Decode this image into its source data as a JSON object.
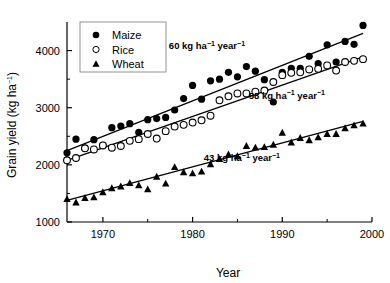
{
  "chart_data": {
    "type": "scatter",
    "title": "",
    "xlabel": "Year",
    "ylabel": "Grain yield (kg ha⁻¹)",
    "xlim": [
      1966,
      2000
    ],
    "ylim": [
      1000,
      4500
    ],
    "xticks": [
      1970,
      1980,
      1990,
      2000
    ],
    "xtick_labels": [
      "1970",
      "1980",
      "1990",
      "2000"
    ],
    "xminor": [
      1975,
      1985,
      1995
    ],
    "yticks": [
      1000,
      2000,
      3000,
      4000
    ],
    "ytick_labels": [
      "1000",
      "2000",
      "3000",
      "4000"
    ],
    "yminor": [
      1500,
      2500,
      3500
    ],
    "grid": false,
    "legend_position": "top-left",
    "series": [
      {
        "name": "Maize",
        "marker": "filled-circle",
        "color": "#000000",
        "x": [
          1966,
          1967,
          1968,
          1969,
          1970,
          1971,
          1972,
          1973,
          1974,
          1975,
          1976,
          1977,
          1978,
          1979,
          1980,
          1981,
          1982,
          1983,
          1984,
          1985,
          1986,
          1987,
          1988,
          1989,
          1990,
          1991,
          1992,
          1993,
          1994,
          1995,
          1996,
          1997,
          1998,
          1999
        ],
        "y": [
          2210,
          2450,
          2290,
          2440,
          2340,
          2650,
          2680,
          2720,
          2570,
          2790,
          2810,
          2830,
          2960,
          3160,
          3390,
          3150,
          3470,
          3500,
          3620,
          3540,
          3720,
          3640,
          3490,
          3100,
          3620,
          3690,
          3690,
          3900,
          3770,
          4100,
          3800,
          4160,
          4110,
          4440
        ],
        "fit_label": "60 kg ha⁻¹ year⁻¹",
        "fit_slope": 60,
        "fit_intercept_year": 1966,
        "fit_y_start": 2250,
        "fit_y_end": 4300
      },
      {
        "name": "Rice",
        "marker": "open-circle",
        "color": "#000000",
        "x": [
          1966,
          1967,
          1968,
          1969,
          1970,
          1971,
          1972,
          1973,
          1974,
          1975,
          1976,
          1977,
          1978,
          1979,
          1980,
          1981,
          1982,
          1983,
          1984,
          1985,
          1986,
          1987,
          1988,
          1989,
          1990,
          1991,
          1992,
          1993,
          1994,
          1995,
          1996,
          1997,
          1998,
          1999
        ],
        "y": [
          2080,
          2120,
          2290,
          2270,
          2340,
          2300,
          2330,
          2420,
          2450,
          2540,
          2460,
          2590,
          2670,
          2700,
          2740,
          2780,
          2860,
          3130,
          3200,
          3250,
          3250,
          3280,
          3300,
          3450,
          3570,
          3610,
          3620,
          3670,
          3680,
          3740,
          3650,
          3800,
          3820,
          3850
        ],
        "fit_label": "58 kg ha⁻¹ year⁻¹",
        "fit_slope": 58,
        "fit_intercept_year": 1966,
        "fit_y_start": 2080,
        "fit_y_end": 3890
      },
      {
        "name": "Wheat",
        "marker": "filled-triangle",
        "color": "#000000",
        "x": [
          1966,
          1967,
          1968,
          1969,
          1970,
          1971,
          1972,
          1973,
          1974,
          1975,
          1976,
          1977,
          1978,
          1979,
          1980,
          1981,
          1982,
          1983,
          1984,
          1985,
          1986,
          1987,
          1988,
          1989,
          1990,
          1991,
          1992,
          1993,
          1994,
          1995,
          1996,
          1997,
          1998,
          1999
        ],
        "y": [
          1400,
          1340,
          1420,
          1430,
          1520,
          1590,
          1620,
          1680,
          1640,
          1570,
          1790,
          1670,
          1960,
          1870,
          1850,
          1880,
          2010,
          2100,
          2180,
          2150,
          2330,
          2300,
          2310,
          2350,
          2560,
          2390,
          2470,
          2430,
          2480,
          2540,
          2540,
          2640,
          2690,
          2720
        ],
        "fit_label": "43 kg ha⁻¹ year⁻¹",
        "fit_slope": 43,
        "fit_intercept_year": 1966,
        "fit_y_start": 1380,
        "fit_y_end": 2760
      }
    ],
    "annotations": [
      {
        "text": "60 kg ha⁻¹ year⁻¹",
        "x": 1981.6,
        "y": 4020
      },
      {
        "text": "58 kg ha⁻¹ year⁻¹",
        "x": 1990.5,
        "y": 3160
      },
      {
        "text": "43 kg ha⁻¹ year⁻¹",
        "x": 1985.5,
        "y": 2060
      }
    ]
  },
  "legend": {
    "items": [
      {
        "label": "Maize",
        "marker": "filled-circle"
      },
      {
        "label": "Rice",
        "marker": "open-circle"
      },
      {
        "label": "Wheat",
        "marker": "filled-triangle"
      }
    ]
  },
  "axes": {
    "x_title": "Year",
    "y_title_main": "Grain yield (kg ha",
    "y_title_sup": "−1",
    "y_title_tail": ")"
  }
}
